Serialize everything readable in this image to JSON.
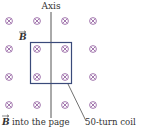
{
  "diagram": {
    "axis_label": "Axis",
    "field_label": "B",
    "caption_field": "into the page",
    "caption_field_vector": "B",
    "coil_label": "50-turn coil",
    "field_symbol": "cross-into-page",
    "colors": {
      "field_symbol": "#9a6aa6",
      "coil": "#3a4a7a",
      "axis": "#555555",
      "text": "#333333"
    },
    "grid": {
      "columns": 4,
      "rows": 4
    }
  }
}
